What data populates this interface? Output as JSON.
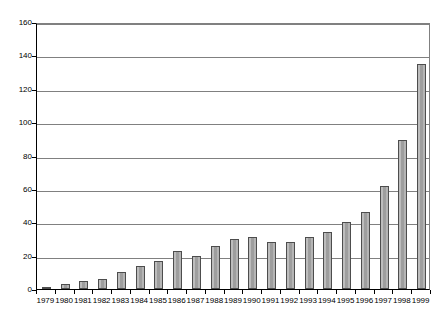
{
  "chart_data": {
    "type": "bar",
    "title": "",
    "xlabel": "",
    "ylabel": "",
    "grid": true,
    "legend": false,
    "ylim": [
      0,
      160
    ],
    "ytick_values": [
      0,
      20,
      40,
      60,
      80,
      100,
      120,
      140,
      160
    ],
    "ytick_labels": [
      "0",
      "20",
      "40",
      "60",
      "80",
      "100",
      "120",
      "140",
      "160"
    ],
    "categories": [
      "1979",
      "1980",
      "1981",
      "1982",
      "1983",
      "1984",
      "1985",
      "1986",
      "1987",
      "1988",
      "1989",
      "1990",
      "1991",
      "1992",
      "1993",
      "1994",
      "1995",
      "1996",
      "1997",
      "1998",
      "1999"
    ],
    "values": [
      1,
      3,
      5,
      6,
      10,
      14,
      17,
      23,
      20,
      26,
      30,
      31,
      28,
      28,
      31,
      34,
      40,
      46,
      62,
      89,
      135
    ],
    "bar_fill_color": "#a8a8a8",
    "bar_edge_color": "#4d4d4d",
    "grid_color": "#808080",
    "axis_color": "#000000",
    "background_color": "#ffffff"
  }
}
